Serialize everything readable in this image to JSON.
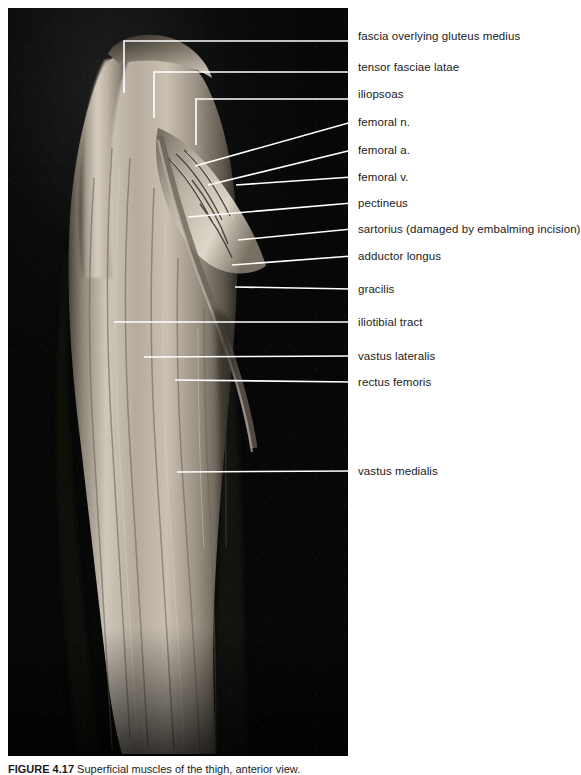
{
  "figure": {
    "caption_label": "FIGURE 4.17",
    "caption_text": "Superficial muscles of the thigh, anterior view.",
    "photo": {
      "kind": "cadaver-dissection-photograph",
      "tone": "grayscale",
      "background_color": "#0a0a0a",
      "specimen_color": "#b8b0a4",
      "region": "right thigh, anterior aspect"
    },
    "leader_color": "#ffffff",
    "text_color": "#1b1b1b",
    "labels": [
      {
        "id": "fascia-gluteus-medius",
        "text": "fascia overlying gluteus medius",
        "label_x": 358,
        "label_y": 36,
        "tip_x": 124,
        "tip_y": 93,
        "style": "elbow",
        "elbow_x": 124,
        "elbow_y": 41
      },
      {
        "id": "tensor-fasciae-latae",
        "text": "tensor fasciae latae",
        "label_x": 358,
        "label_y": 67,
        "tip_x": 154,
        "tip_y": 118,
        "style": "elbow",
        "elbow_x": 154,
        "elbow_y": 72
      },
      {
        "id": "iliopsoas",
        "text": "iliopsoas",
        "label_x": 358,
        "label_y": 94,
        "tip_x": 196,
        "tip_y": 145,
        "style": "elbow",
        "elbow_x": 196,
        "elbow_y": 99
      },
      {
        "id": "femoral-n",
        "text": "femoral n.",
        "label_x": 358,
        "label_y": 122,
        "tip_x": 195,
        "tip_y": 166,
        "style": "slant"
      },
      {
        "id": "femoral-a",
        "text": "femoral a.",
        "label_x": 358,
        "label_y": 150,
        "tip_x": 208,
        "tip_y": 185,
        "style": "slant"
      },
      {
        "id": "femoral-v",
        "text": "femoral v.",
        "label_x": 358,
        "label_y": 177,
        "tip_x": 236,
        "tip_y": 185,
        "style": "slant"
      },
      {
        "id": "pectineus",
        "text": "pectineus",
        "label_x": 358,
        "label_y": 203,
        "tip_x": 188,
        "tip_y": 217,
        "style": "slant"
      },
      {
        "id": "sartorius",
        "text": "sartorius (damaged by embalming incision)",
        "label_x": 358,
        "label_y": 229,
        "tip_x": 238,
        "tip_y": 240,
        "style": "slant"
      },
      {
        "id": "adductor-longus",
        "text": "adductor longus",
        "label_x": 358,
        "label_y": 256,
        "tip_x": 232,
        "tip_y": 265,
        "style": "slant"
      },
      {
        "id": "gracilis",
        "text": "gracilis",
        "label_x": 358,
        "label_y": 289,
        "tip_x": 235,
        "tip_y": 287,
        "style": "slant"
      },
      {
        "id": "iliotibial-tract",
        "text": "iliotibial tract",
        "label_x": 358,
        "label_y": 322,
        "tip_x": 114,
        "tip_y": 322,
        "style": "slant"
      },
      {
        "id": "vastus-lateralis",
        "text": "vastus lateralis",
        "label_x": 358,
        "label_y": 356,
        "tip_x": 144,
        "tip_y": 357,
        "style": "slant"
      },
      {
        "id": "rectus-femoris",
        "text": "rectus femoris",
        "label_x": 358,
        "label_y": 382,
        "tip_x": 175,
        "tip_y": 380,
        "style": "slant"
      },
      {
        "id": "vastus-medialis",
        "text": "vastus medialis",
        "label_x": 358,
        "label_y": 471,
        "tip_x": 177,
        "tip_y": 472,
        "style": "slant"
      }
    ]
  }
}
